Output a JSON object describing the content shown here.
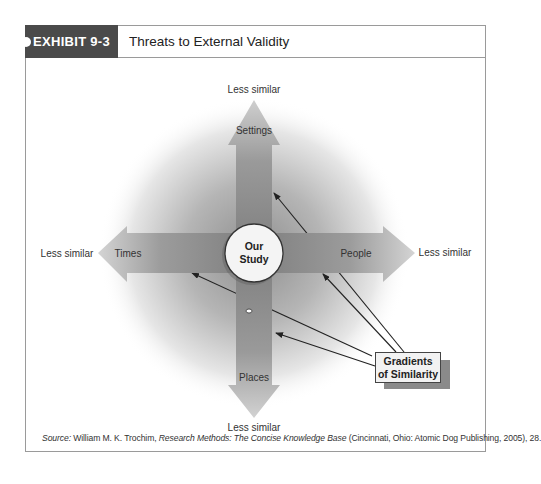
{
  "exhibit": {
    "number_label": "EXHIBIT 9-3",
    "title": "Threats to External Validity"
  },
  "diagram": {
    "center": {
      "line1": "Our",
      "line2": "Study"
    },
    "axes": {
      "up": {
        "label": "Settings",
        "end_label": "Less similar"
      },
      "down": {
        "label": "Places",
        "end_label": "Less similar"
      },
      "left": {
        "label": "Times",
        "end_label": "Less similar"
      },
      "right": {
        "label": "People",
        "end_label": "Less similar"
      }
    },
    "callout": {
      "line1": "Gradients",
      "line2": "of Similarity"
    },
    "colors": {
      "header_bg": "#4a4a4a",
      "arrow_fill": "#8a8a8a",
      "glow": "#9c9c9c",
      "circle_fill": "#f4f4f4"
    }
  },
  "source": {
    "prefix": "Source:",
    "author": " William M. K.  Trochim, ",
    "book": "Research Methods: The Concise Knowledge Base",
    "rest": " (Cincinnati, Ohio: Atomic Dog Publishing, 2005), 28."
  }
}
